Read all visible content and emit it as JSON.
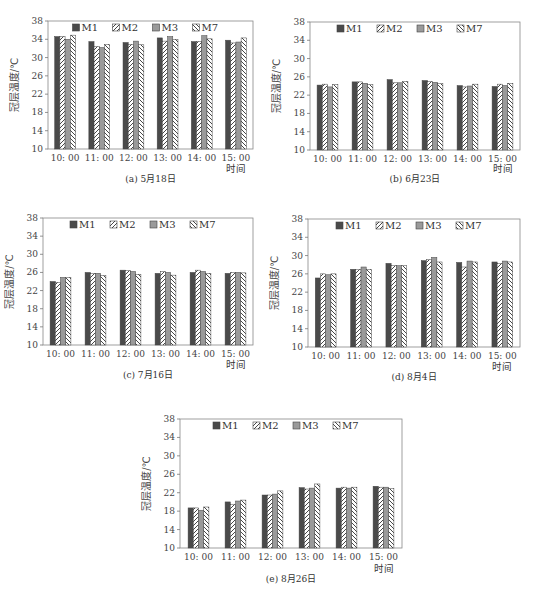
{
  "figure": {
    "series_names": [
      "M1",
      "M2",
      "M3",
      "M7"
    ],
    "series_styles": {
      "M1": {
        "fill": "#4a4a4a",
        "pattern": "solid"
      },
      "M2": {
        "fill": "#ffffff",
        "pattern": "hatch-forward"
      },
      "M3": {
        "fill": "#9a9a9a",
        "pattern": "solid"
      },
      "M7": {
        "fill": "#ffffff",
        "pattern": "hatch-backward"
      }
    },
    "ylabel": "冠层温度/℃",
    "xlabel": "时间",
    "yticks": [
      10,
      14,
      18,
      22,
      26,
      30,
      34,
      38
    ]
  },
  "chart_data": [
    {
      "type": "bar",
      "title": "(a) 5月18日",
      "xlabel": "时间",
      "ylabel": "冠层温度/℃",
      "ylim": [
        10,
        38
      ],
      "categories": [
        "10: 00",
        "11: 00",
        "12: 00",
        "13: 00",
        "14: 00",
        "15: 00"
      ],
      "series": [
        {
          "name": "M1",
          "values": [
            34.6,
            33.5,
            33.3,
            34.3,
            33.5,
            33.8
          ]
        },
        {
          "name": "M2",
          "values": [
            34.6,
            32.4,
            32.9,
            33.6,
            33.5,
            33.2
          ]
        },
        {
          "name": "M3",
          "values": [
            34.0,
            32.2,
            33.6,
            34.6,
            34.8,
            33.4
          ]
        },
        {
          "name": "M7",
          "values": [
            34.9,
            32.9,
            32.8,
            34.0,
            34.1,
            34.3
          ]
        }
      ],
      "legend_position": "top-inside",
      "grid": false
    },
    {
      "type": "bar",
      "title": "(b) 6月23日",
      "xlabel": "时间",
      "ylabel": "冠层温度/℃",
      "ylim": [
        10,
        38
      ],
      "categories": [
        "10: 00",
        "11: 00",
        "12: 00",
        "13: 00",
        "14: 00",
        "15: 00"
      ],
      "series": [
        {
          "name": "M1",
          "values": [
            24.2,
            24.9,
            25.4,
            25.2,
            24.1,
            23.9
          ]
        },
        {
          "name": "M2",
          "values": [
            24.4,
            24.9,
            24.7,
            25.0,
            23.8,
            24.4
          ]
        },
        {
          "name": "M3",
          "values": [
            23.8,
            24.6,
            24.7,
            24.8,
            24.0,
            24.1
          ]
        },
        {
          "name": "M7",
          "values": [
            24.3,
            24.3,
            25.0,
            24.5,
            24.4,
            24.6
          ]
        }
      ],
      "legend_position": "top-inside",
      "grid": false
    },
    {
      "type": "bar",
      "title": "(c) 7月16日",
      "xlabel": "时间",
      "ylabel": "冠层温度/℃",
      "ylim": [
        10,
        38
      ],
      "categories": [
        "10: 00",
        "11: 00",
        "12: 00",
        "13: 00",
        "14: 00",
        "15: 00"
      ],
      "series": [
        {
          "name": "M1",
          "values": [
            24.0,
            26.0,
            26.5,
            25.8,
            26.0,
            25.8
          ]
        },
        {
          "name": "M2",
          "values": [
            23.8,
            25.8,
            26.4,
            26.2,
            26.5,
            26.0
          ]
        },
        {
          "name": "M3",
          "values": [
            24.9,
            25.8,
            26.2,
            26.0,
            26.2,
            26.0
          ]
        },
        {
          "name": "M7",
          "values": [
            24.9,
            25.3,
            25.6,
            25.4,
            25.8,
            25.9
          ]
        }
      ],
      "legend_position": "top-inside",
      "grid": false
    },
    {
      "type": "bar",
      "title": "(d) 8月4日",
      "xlabel": "时间",
      "ylabel": "冠层温度/℃",
      "ylim": [
        10,
        38
      ],
      "categories": [
        "10: 00",
        "11: 00",
        "12: 00",
        "13: 00",
        "14: 00",
        "15: 00"
      ],
      "series": [
        {
          "name": "M1",
          "values": [
            25.1,
            27.0,
            28.3,
            28.9,
            28.5,
            28.6
          ]
        },
        {
          "name": "M2",
          "values": [
            26.0,
            27.0,
            27.8,
            29.1,
            27.5,
            28.3
          ]
        },
        {
          "name": "M3",
          "values": [
            25.8,
            27.5,
            27.8,
            29.6,
            28.8,
            28.8
          ]
        },
        {
          "name": "M7",
          "values": [
            26.0,
            27.0,
            27.8,
            28.6,
            28.6,
            28.6
          ]
        }
      ],
      "legend_position": "top-inside",
      "grid": false
    },
    {
      "type": "bar",
      "title": "(e) 8月26日",
      "xlabel": "时间",
      "ylabel": "冠层温度/℃",
      "ylim": [
        10,
        38
      ],
      "categories": [
        "10: 00",
        "11: 00",
        "12: 00",
        "13: 00",
        "14: 00",
        "15: 00"
      ],
      "series": [
        {
          "name": "M1",
          "values": [
            18.7,
            20.0,
            21.5,
            23.1,
            23.0,
            23.4
          ]
        },
        {
          "name": "M2",
          "values": [
            18.7,
            19.5,
            21.5,
            22.8,
            23.2,
            23.2
          ]
        },
        {
          "name": "M3",
          "values": [
            18.2,
            20.2,
            21.7,
            23.0,
            23.0,
            23.2
          ]
        },
        {
          "name": "M7",
          "values": [
            18.9,
            20.4,
            22.4,
            23.9,
            23.2,
            22.9
          ]
        }
      ],
      "legend_position": "top-inside",
      "grid": false
    }
  ],
  "panels": [
    {
      "caption": "(a) 5月18日"
    },
    {
      "caption": "(b) 6月23日"
    },
    {
      "caption": "(c) 7月16日"
    },
    {
      "caption": "(d) 8月4日"
    },
    {
      "caption": "(e) 8月26日"
    }
  ]
}
